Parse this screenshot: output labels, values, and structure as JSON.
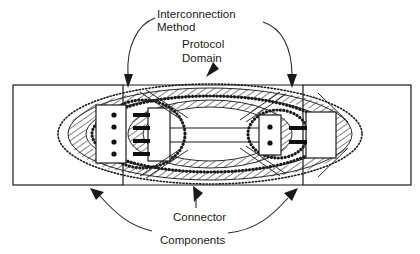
{
  "diagram": {
    "labels": {
      "interconnection": "Interconnection",
      "method": "Method",
      "protocol": "Protocol",
      "domain": "Domain",
      "connector": "Connector",
      "components": "Components"
    },
    "colors": {
      "stroke": "#1a1a1a",
      "background": "#ffffff",
      "fill_dark": "#101010"
    },
    "structure": {
      "left_component_dots": 4,
      "right_component_dots": 2,
      "left_connector_pins": 4,
      "right_connector_pins": 2,
      "signal_lines": 2,
      "boundary_regions": 3
    }
  }
}
